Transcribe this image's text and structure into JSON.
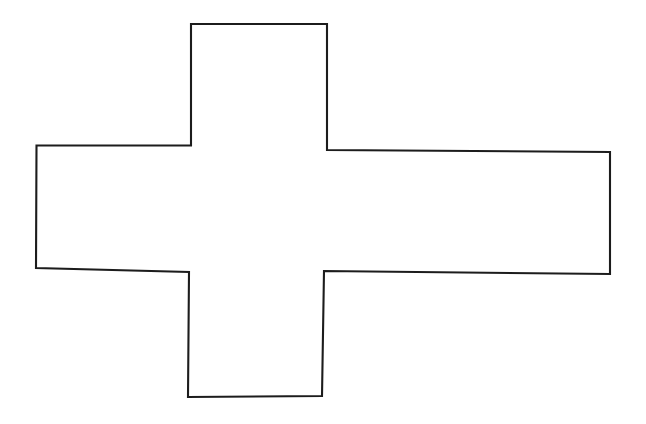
{
  "page": {
    "background_color": "#ffffff",
    "width": 646,
    "height": 424
  },
  "figure": {
    "name": "cross-polygon",
    "stroke_color": "#1c1c1c",
    "fill_color": "#ffffff",
    "stroke_width": 2.1,
    "vertex_count": 12,
    "points": "191,24 327,24 327,150 610,152 610,274 324,271 322,396 188,397 189,272 36,268 36.5,145.5 191,145.5",
    "vertices": [
      {
        "name": "top-arm-top-left",
        "x": 191,
        "y": 24
      },
      {
        "name": "top-arm-top-right",
        "x": 327,
        "y": 24
      },
      {
        "name": "top-arm-bottom-right",
        "x": 327,
        "y": 150
      },
      {
        "name": "right-arm-top-right",
        "x": 610,
        "y": 152
      },
      {
        "name": "right-arm-bottom-right",
        "x": 610,
        "y": 274
      },
      {
        "name": "bottom-arm-top-right",
        "x": 324,
        "y": 271
      },
      {
        "name": "bottom-arm-bottom-right",
        "x": 322,
        "y": 396
      },
      {
        "name": "bottom-arm-bottom-left",
        "x": 188,
        "y": 397
      },
      {
        "name": "bottom-arm-top-left",
        "x": 189,
        "y": 272
      },
      {
        "name": "left-arm-bottom-left",
        "x": 36,
        "y": 268
      },
      {
        "name": "left-arm-top-left",
        "x": 36.5,
        "y": 145.5
      },
      {
        "name": "top-arm-bottom-left",
        "x": 191,
        "y": 145.5
      }
    ]
  },
  "chart_data": {
    "type": "scatter",
    "title": "",
    "xlabel": "",
    "ylabel": "",
    "xlim": [
      0,
      646
    ],
    "ylim": [
      0,
      424
    ],
    "grid": false,
    "legend": "none",
    "series": [
      {
        "name": "cross-outline",
        "closed": true,
        "x": [
          191,
          327,
          327,
          610,
          610,
          324,
          322,
          188,
          189,
          36,
          36.5,
          191
        ],
        "y": [
          24,
          24,
          150,
          152,
          274,
          271,
          396,
          397,
          272,
          268,
          145.5,
          145.5
        ]
      }
    ]
  }
}
